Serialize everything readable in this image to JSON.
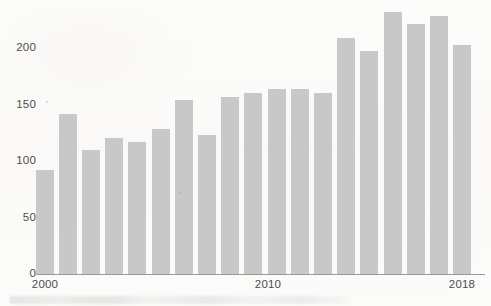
{
  "chart_data": {
    "type": "bar",
    "title": "",
    "subtitle": "",
    "xlabel": "",
    "ylabel": "",
    "categories": [
      "2000",
      "2001",
      "2002",
      "2003",
      "2004",
      "2005",
      "2006",
      "2007",
      "2008",
      "2009",
      "2010",
      "2011",
      "2012",
      "2013",
      "2014",
      "2015",
      "2016",
      "2017",
      "2018"
    ],
    "values": [
      92,
      142,
      110,
      120,
      117,
      128,
      154,
      123,
      157,
      160,
      164,
      164,
      160,
      209,
      197,
      232,
      221,
      228,
      203
    ],
    "series": [
      {
        "name": "",
        "values": [
          92,
          142,
          110,
          120,
          117,
          128,
          154,
          123,
          157,
          160,
          164,
          164,
          160,
          209,
          197,
          232,
          221,
          228,
          203
        ]
      }
    ],
    "ylim": [
      0,
      240
    ],
    "xlim": [
      "2000",
      "2018"
    ],
    "yticks": [
      0,
      50,
      100,
      150,
      200
    ],
    "ytick_labels": [
      "0",
      "50",
      "100",
      "150",
      "200"
    ],
    "xticks": [
      "2000",
      "2010",
      "2018"
    ],
    "xtick_labels": [
      "2000",
      "2010",
      "2018"
    ],
    "grid": false,
    "legend": null,
    "legend_position": "none",
    "annotations": [],
    "colors": {
      "bar_fill": "#c8c8c8",
      "axis_line": "#9a9a9a",
      "tick_text": "#4d4d4d",
      "background": "#fbfbfa"
    }
  },
  "axes": {
    "y_axis_label": "",
    "x_axis_label": ""
  }
}
